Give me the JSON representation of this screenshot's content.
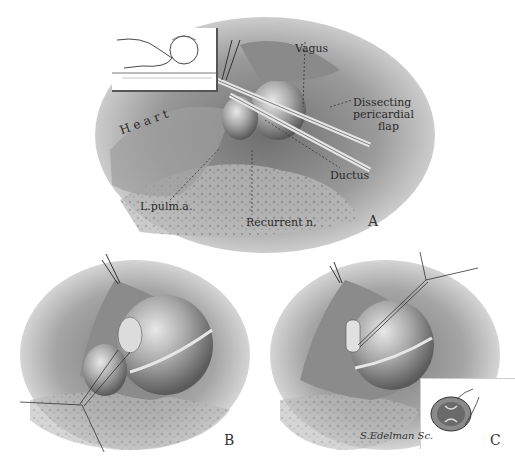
{
  "figure": {
    "panels": [
      {
        "id": "A",
        "letter": "A",
        "labels": {
          "vagus": "Vagus",
          "heart": "H e a r t",
          "dissecting_line1": "Dissecting",
          "dissecting_line2": "pericardial",
          "dissecting_line3": "flap",
          "ductus": "Ductus",
          "l_pulm_a": "L.pulm.a.",
          "recurrent_n": "Recurrent n."
        },
        "inset": "patient-position-sketch"
      },
      {
        "id": "B",
        "letter": "B"
      },
      {
        "id": "C",
        "letter": "C",
        "inset": "ductus-cross-section",
        "signature": "S.Edelman Sc."
      }
    ]
  }
}
